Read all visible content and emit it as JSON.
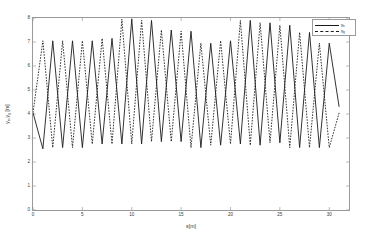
{
  "chart_data": {
    "type": "line",
    "title": "",
    "xlabel": "s[m]",
    "ylabel": "y_e , y_g  [m]",
    "xlabel_parts": {
      "base": "s",
      "unit": "[m]"
    },
    "ylabel_parts": {
      "base1": "y",
      "sub1": "e",
      "base2": "y",
      "sub2": "g",
      "unit": "[m]"
    },
    "xlim": [
      0,
      32
    ],
    "ylim": [
      0,
      8
    ],
    "xticks": [
      0,
      5,
      10,
      15,
      20,
      25,
      30
    ],
    "xticklabels": [
      "0",
      "5",
      "10",
      "15",
      "20",
      "25",
      "30"
    ],
    "yticks": [
      0,
      1,
      2,
      3,
      4,
      5,
      6,
      7,
      8
    ],
    "yticklabels": [
      "0",
      "1",
      "2",
      "3",
      "4",
      "5",
      "6",
      "7",
      "8"
    ],
    "grid": false,
    "legend_position": "top-right",
    "series": [
      {
        "name": "y_e",
        "label_base": "y",
        "label_sub": "e",
        "style": "solid",
        "color": "#1a1a1a",
        "x": [
          0,
          1,
          3,
          5,
          7,
          9,
          11,
          13,
          15,
          17,
          19,
          21,
          23,
          25,
          27,
          29,
          31,
          32
        ],
        "y": [
          4.05,
          2.55,
          7.05,
          7.05,
          7.05,
          7.15,
          7.95,
          2.85,
          7.5,
          2.6,
          6.95,
          2.75,
          7.9,
          2.7,
          7.7,
          2.6,
          6.95,
          4.3
        ]
      },
      {
        "name": "y_g",
        "label_base": "y",
        "label_sub": "g",
        "style": "dashed",
        "color": "#1a1a1a",
        "x": [
          0,
          1,
          3,
          5,
          7,
          9,
          11,
          13,
          15,
          17,
          19,
          21,
          23,
          25,
          27,
          29,
          31,
          32
        ],
        "y": [
          4.05,
          7.05,
          2.6,
          2.6,
          2.75,
          2.75,
          2.75,
          7.9,
          2.85,
          7.45,
          2.9,
          7.05,
          2.7,
          7.8,
          2.8,
          7.4,
          2.6,
          4.05
        ]
      }
    ],
    "series_points": {
      "solid": [
        [
          0,
          4.05
        ],
        [
          1,
          2.55
        ],
        [
          2,
          7.05
        ],
        [
          3,
          2.6
        ],
        [
          4,
          7.05
        ],
        [
          5,
          2.6
        ],
        [
          6,
          7.05
        ],
        [
          7,
          2.75
        ],
        [
          8,
          7.15
        ],
        [
          9,
          2.75
        ],
        [
          10,
          7.95
        ],
        [
          11,
          2.75
        ],
        [
          12,
          7.9
        ],
        [
          13,
          2.85
        ],
        [
          14,
          7.5
        ],
        [
          15,
          2.85
        ],
        [
          16,
          7.45
        ],
        [
          17,
          2.6
        ],
        [
          18,
          6.95
        ],
        [
          19,
          2.7
        ],
        [
          20,
          7.05
        ],
        [
          21,
          2.75
        ],
        [
          22,
          7.9
        ],
        [
          23,
          2.7
        ],
        [
          24,
          7.8
        ],
        [
          25,
          2.8
        ],
        [
          26,
          7.7
        ],
        [
          27,
          2.6
        ],
        [
          28,
          7.4
        ],
        [
          29,
          2.6
        ],
        [
          30,
          6.95
        ],
        [
          31,
          4.3
        ]
      ],
      "dashed": [
        [
          0,
          4.05
        ],
        [
          1,
          7.05
        ],
        [
          2,
          2.6
        ],
        [
          3,
          7.05
        ],
        [
          4,
          2.6
        ],
        [
          5,
          7.05
        ],
        [
          6,
          2.75
        ],
        [
          7,
          7.15
        ],
        [
          8,
          2.75
        ],
        [
          9,
          7.95
        ],
        [
          10,
          2.75
        ],
        [
          11,
          7.9
        ],
        [
          12,
          2.85
        ],
        [
          13,
          7.5
        ],
        [
          14,
          2.85
        ],
        [
          15,
          7.45
        ],
        [
          16,
          2.6
        ],
        [
          17,
          6.95
        ],
        [
          18,
          2.7
        ],
        [
          19,
          7.05
        ],
        [
          20,
          2.75
        ],
        [
          21,
          7.9
        ],
        [
          22,
          2.7
        ],
        [
          23,
          7.8
        ],
        [
          24,
          2.8
        ],
        [
          25,
          7.7
        ],
        [
          26,
          2.6
        ],
        [
          27,
          7.4
        ],
        [
          28,
          2.6
        ],
        [
          29,
          6.95
        ],
        [
          30,
          2.6
        ],
        [
          31,
          4.05
        ]
      ]
    }
  },
  "legend": {
    "items": [
      {
        "label_base": "y",
        "label_sub": "e",
        "style": "solid"
      },
      {
        "label_base": "y",
        "label_sub": "g",
        "style": "dashed"
      }
    ]
  }
}
